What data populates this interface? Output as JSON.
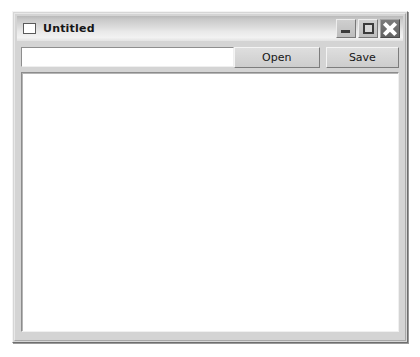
{
  "window": {
    "title": "Untitled",
    "icon": "window-icon",
    "controls": [
      {
        "name": "minimize",
        "glyph": "_"
      },
      {
        "name": "maximize",
        "glyph": "square"
      },
      {
        "name": "close",
        "glyph": "x"
      }
    ]
  },
  "toolbar": {
    "path_value": "",
    "path_placeholder": "",
    "open_label": "Open",
    "save_label": "Save"
  },
  "content": {
    "text": ""
  },
  "colors": {
    "window_face": "#d4d4d4",
    "titlebar_light": "#f2f2f2",
    "titlebar_dark": "#b9b9b9",
    "text": "#161616",
    "field_background": "#ffffff",
    "close_button": "#6f6f6f"
  }
}
